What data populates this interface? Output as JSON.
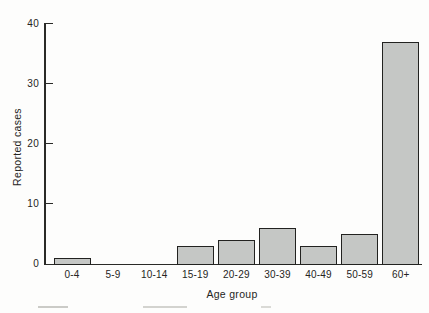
{
  "chart_data": {
    "type": "bar",
    "categories": [
      "0-4",
      "5-9",
      "10-14",
      "15-19",
      "20-29",
      "30-39",
      "40-49",
      "50-59",
      "60+"
    ],
    "values": [
      1,
      0,
      0,
      3,
      4,
      6,
      3,
      5,
      37
    ],
    "title": "",
    "xlabel": "Age group",
    "ylabel": "Reported cases",
    "ylim": [
      0,
      40
    ],
    "yticks": [
      0,
      10,
      20,
      30,
      40
    ],
    "grid": false,
    "legend": null,
    "colors": {
      "bar_fill": "#c5c7c5",
      "bar_border": "#222220",
      "axis": "#2a2a27",
      "text": "#252523"
    }
  }
}
